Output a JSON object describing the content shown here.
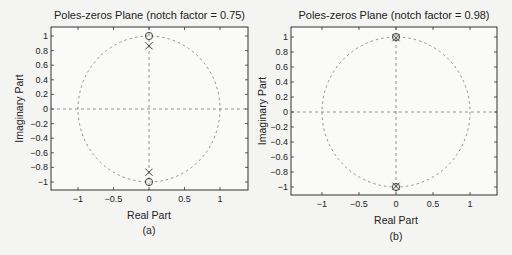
{
  "chart_data": [
    {
      "type": "scatter",
      "panel_label": "(a)",
      "title": "Poles-zeros Plane (notch factor = 0.75)",
      "xlabel": "Real Part",
      "ylabel": "Imaginary Part",
      "xlim": [
        -1.38,
        1.38
      ],
      "ylim": [
        -1.12,
        1.12
      ],
      "xticks": [
        "-1",
        "-0.5",
        "0",
        "0.5",
        "1"
      ],
      "yticks": [
        "1",
        "0.8",
        "0.6",
        "0.4",
        "0.2",
        "0",
        "-0.2",
        "-0.4",
        "-0.6",
        "-0.8",
        "-1"
      ],
      "unit_circle": true,
      "grid": false,
      "series": [
        {
          "name": "zeros",
          "marker": "o",
          "points": [
            [
              0,
              1
            ],
            [
              0,
              -1
            ]
          ]
        },
        {
          "name": "poles",
          "marker": "x",
          "points": [
            [
              0,
              0.866
            ],
            [
              0,
              -0.866
            ]
          ]
        }
      ]
    },
    {
      "type": "scatter",
      "panel_label": "(b)",
      "title": "Poles-zeros Plane (notch factor = 0.98)",
      "xlabel": "Real Part",
      "ylabel": "Imaginary Part",
      "xlim": [
        -1.38,
        1.38
      ],
      "ylim": [
        -1.12,
        1.12
      ],
      "xticks": [
        "-1",
        "-0.5",
        "0",
        "0.5",
        "1"
      ],
      "yticks": [
        "1",
        "0.8",
        "0.6",
        "0.4",
        "0.2",
        "0",
        "-0.2",
        "-0.4",
        "-0.6",
        "-0.8",
        "-1"
      ],
      "unit_circle": true,
      "grid": false,
      "series": [
        {
          "name": "zeros",
          "marker": "o",
          "points": [
            [
              0,
              1
            ],
            [
              0,
              -1
            ]
          ]
        },
        {
          "name": "poles",
          "marker": "x",
          "points": [
            [
              0,
              0.99
            ],
            [
              0,
              -0.99
            ]
          ]
        }
      ]
    }
  ]
}
